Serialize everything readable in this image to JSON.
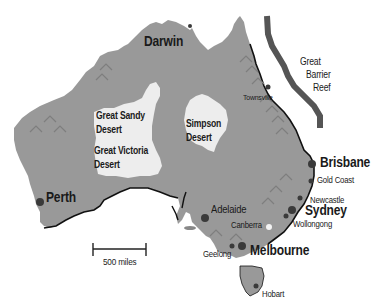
{
  "map": {
    "title": "Australia",
    "colors": {
      "land": "#999999",
      "desert": "#ededed",
      "coastline": "#111111",
      "reef": "#555555",
      "city_dot": "#3a3a3a",
      "capital_dot": "#f4f4f4",
      "mountain": "#8a8a8a",
      "background": "#ffffff"
    },
    "cities": [
      {
        "name": "Darwin",
        "size": "big"
      },
      {
        "name": "Perth",
        "size": "big"
      },
      {
        "name": "Adelaide",
        "size": "med"
      },
      {
        "name": "Melbourne",
        "size": "big"
      },
      {
        "name": "Sydney",
        "size": "big"
      },
      {
        "name": "Brisbane",
        "size": "big"
      },
      {
        "name": "Gold Coast",
        "size": "sm"
      },
      {
        "name": "Newcastle",
        "size": "sm"
      },
      {
        "name": "Wollongong",
        "size": "sm"
      },
      {
        "name": "Canberra",
        "size": "sm"
      },
      {
        "name": "Geelong",
        "size": "sm"
      },
      {
        "name": "Hobart",
        "size": "sm"
      },
      {
        "name": "Townsville",
        "size": "sm"
      }
    ],
    "deserts": [
      {
        "line1": "Great Sandy",
        "line2": "Desert"
      },
      {
        "line1": "Great Victoria",
        "line2": "Desert"
      },
      {
        "line1": "Simpson",
        "line2": "Desert"
      }
    ],
    "reef": {
      "line1": "Great",
      "line2": "Barrier",
      "line3": "Reef"
    },
    "scale_bar": {
      "label": "500 miles"
    }
  }
}
